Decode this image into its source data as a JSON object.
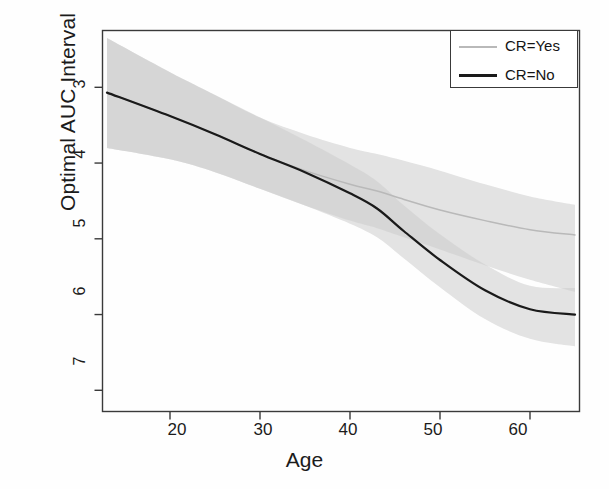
{
  "chart_data": {
    "type": "line",
    "title": "",
    "xlabel": "Age",
    "ylabel": "Optimal AUC Interval",
    "xlim": [
      12.5,
      65.5
    ],
    "ylim": [
      2.72,
      7.75
    ],
    "xticks": [
      20,
      30,
      40,
      50,
      60
    ],
    "yticks": [
      3,
      4,
      5,
      6,
      7
    ],
    "grid": false,
    "legend_position": "top-right",
    "legend": [
      "CR=Yes",
      "CR=No"
    ],
    "colors": {
      "cr_yes_line": "#b9b9b9",
      "cr_no_line": "#1a1a1a",
      "ribbon": "#cccccc",
      "axis": "#3a3a3a",
      "text": "#1b1b1b",
      "background": "#ffffff"
    },
    "series": [
      {
        "name": "CR=Yes",
        "x": [
          13,
          20,
          25,
          30,
          35,
          40,
          43,
          46,
          50,
          55,
          60,
          65
        ],
        "values": [
          6.93,
          6.62,
          6.38,
          6.12,
          5.9,
          5.72,
          5.63,
          5.52,
          5.38,
          5.24,
          5.12,
          5.05
        ],
        "band_upper": [
          7.65,
          7.2,
          6.9,
          6.6,
          6.38,
          6.2,
          6.12,
          6.03,
          5.9,
          5.72,
          5.56,
          5.45
        ],
        "band_lower": [
          6.2,
          6.05,
          5.88,
          5.66,
          5.44,
          5.24,
          5.14,
          5.02,
          4.86,
          4.65,
          4.46,
          4.3
        ]
      },
      {
        "name": "CR=No",
        "x": [
          13,
          20,
          25,
          30,
          35,
          40,
          43,
          46,
          50,
          55,
          60,
          65
        ],
        "values": [
          6.93,
          6.62,
          6.38,
          6.12,
          5.88,
          5.6,
          5.4,
          5.1,
          4.72,
          4.32,
          4.07,
          4.0
        ],
        "band_upper": [
          7.65,
          7.2,
          6.9,
          6.6,
          6.3,
          5.98,
          5.76,
          5.44,
          5.06,
          4.66,
          4.38,
          4.35
        ],
        "band_lower": [
          6.2,
          6.05,
          5.88,
          5.66,
          5.44,
          5.2,
          5.02,
          4.74,
          4.36,
          3.94,
          3.68,
          3.58
        ]
      }
    ]
  },
  "axes": {
    "y_title": "Optimal AUC Interval",
    "x_title": "Age",
    "y_tick_labels": [
      "3",
      "4",
      "5",
      "6",
      "7"
    ],
    "x_tick_labels": [
      "20",
      "30",
      "40",
      "50",
      "60"
    ]
  },
  "legend": {
    "items": [
      {
        "label": "CR=Yes",
        "style": "thin-gray-line"
      },
      {
        "label": "CR=No",
        "style": "thick-black-line"
      }
    ]
  }
}
